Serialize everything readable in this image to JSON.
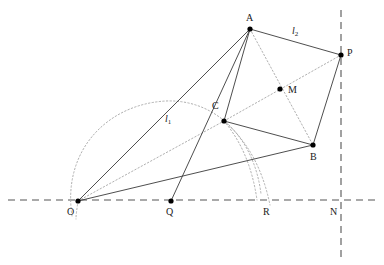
{
  "figure": {
    "background_color": "#ffffff",
    "stroke_color": "#3a3a3a",
    "dotted_color": "#b0b0b0",
    "axis_color": "#555555",
    "point_color": "#000000",
    "width": 384,
    "height": 265
  },
  "points": [
    {
      "id": "A",
      "label": "A",
      "x": 250,
      "y": 29,
      "label_x": 246,
      "label_y": 13,
      "has_dot": true
    },
    {
      "id": "P",
      "label": "P",
      "x": 341,
      "y": 55,
      "label_x": 347,
      "label_y": 48,
      "has_dot": true
    },
    {
      "id": "M",
      "label": "M",
      "x": 280,
      "y": 89,
      "label_x": 288,
      "label_y": 85,
      "has_dot": true
    },
    {
      "id": "C",
      "label": "C",
      "x": 224,
      "y": 121,
      "label_x": 212,
      "label_y": 101,
      "has_dot": true
    },
    {
      "id": "B",
      "label": "B",
      "x": 313,
      "y": 145,
      "label_x": 310,
      "label_y": 152,
      "has_dot": true
    },
    {
      "id": "O",
      "label": "O",
      "x": 78,
      "y": 201,
      "label_x": 67,
      "label_y": 207,
      "has_dot": true
    },
    {
      "id": "Q",
      "label": "Q",
      "x": 171,
      "y": 201,
      "label_x": 166,
      "label_y": 207,
      "has_dot": true
    },
    {
      "id": "R",
      "label": "R",
      "x": 264,
      "y": 201,
      "label_x": 263,
      "label_y": 207,
      "has_dot": false
    },
    {
      "id": "N",
      "label": "N",
      "x": 341,
      "y": 201,
      "label_x": 330,
      "label_y": 207,
      "has_dot": false
    }
  ],
  "line_labels": [
    {
      "id": "l1",
      "text": "l",
      "sub": "1",
      "x": 165,
      "y": 114
    },
    {
      "id": "l2",
      "text": "l",
      "sub": "2",
      "x": 292,
      "y": 26
    }
  ],
  "solid_segments": [
    {
      "name": "segment-O-A",
      "from": "O",
      "to": "A"
    },
    {
      "name": "segment-O-B",
      "from": "O",
      "to": "B"
    },
    {
      "name": "segment-Q-A",
      "from": "Q",
      "to": "A"
    },
    {
      "name": "segment-A-C",
      "from": "A",
      "to": "C"
    },
    {
      "name": "segment-A-P",
      "from": "A",
      "to": "P"
    },
    {
      "name": "segment-C-B",
      "from": "C",
      "to": "B"
    },
    {
      "name": "segment-B-P",
      "from": "B",
      "to": "P"
    }
  ],
  "dotted_segments": [
    {
      "name": "segment-O-C-dotted",
      "from": "O",
      "to": "C"
    },
    {
      "name": "segment-A-B-dotted",
      "from": "A",
      "to": "B"
    },
    {
      "name": "segment-C-P-dotted",
      "from": "C",
      "to": "P"
    }
  ],
  "dotted_arcs": [
    {
      "name": "arc-major-O-center",
      "d": "M 72 216 C 62 150 108 104 166 101 C 214 99 254 136 261 194"
    },
    {
      "name": "arc-from-C-inner",
      "d": "M 224 121 C 240 140 252 165 257 200"
    },
    {
      "name": "arc-from-C-outer",
      "d": "M 224 121 C 246 140 262 166 270 205"
    },
    {
      "name": "arc-tail-below-O",
      "d": "M 78 201 C 77 209 76 214 76 219"
    }
  ],
  "axes": [
    {
      "name": "horizontal-axis",
      "orientation": "horizontal",
      "x1": 8,
      "y1": 200,
      "x2": 378,
      "y2": 200
    },
    {
      "name": "vertical-axis",
      "orientation": "vertical",
      "x1": 341,
      "y1": 10,
      "x2": 341,
      "y2": 262
    }
  ]
}
